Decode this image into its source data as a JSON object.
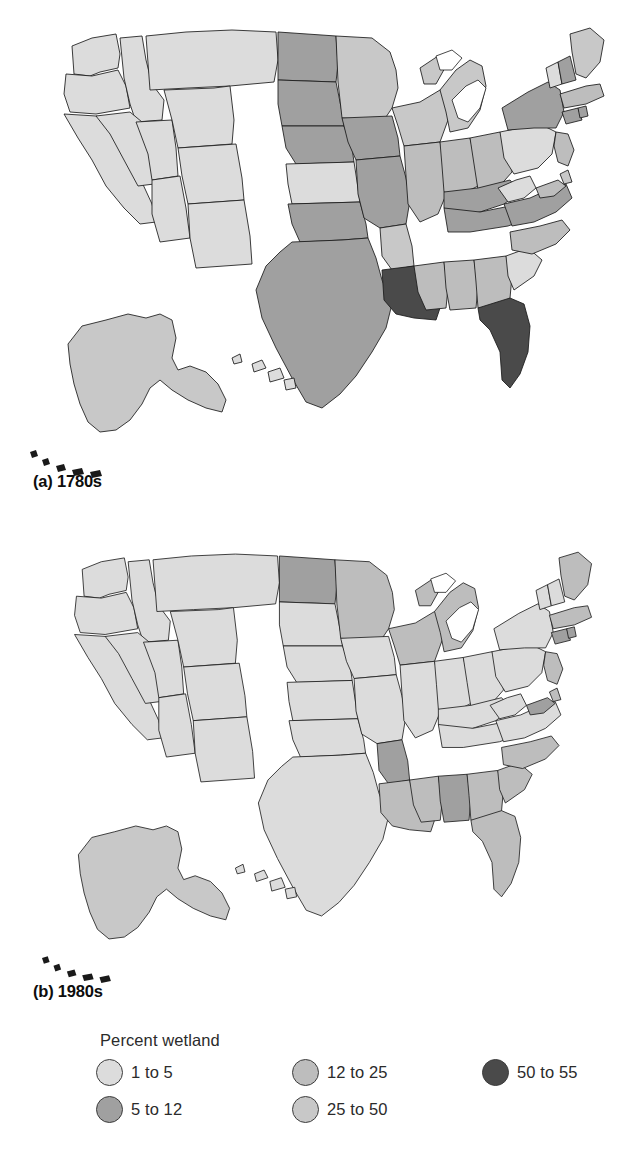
{
  "figure": {
    "panels": [
      {
        "id": "a",
        "label": "(a) 1780s",
        "period": "1780s"
      },
      {
        "id": "b",
        "label": "(b) 1980s",
        "period": "1980s"
      }
    ]
  },
  "legend": {
    "title": "Percent wetland",
    "classes": [
      {
        "label": "1 to 5",
        "color": "#dcdcdc",
        "min": 1,
        "max": 5
      },
      {
        "label": "5 to 12",
        "color": "#a0a0a0",
        "min": 5,
        "max": 12
      },
      {
        "label": "12 to 25",
        "color": "#bdbdbd",
        "min": 12,
        "max": 25
      },
      {
        "label": "25 to 50",
        "color": "#c8c8c8",
        "min": 25,
        "max": 50
      },
      {
        "label": "50 to 55",
        "color": "#4a4a4a",
        "min": 50,
        "max": 55
      }
    ]
  },
  "chart_data": {
    "type": "map",
    "title": "Percent wetland",
    "subtype": "choropleth-pair",
    "legend_position": "bottom",
    "value_unit": "percent of state area that is wetland",
    "class_breaks": [
      1,
      5,
      12,
      25,
      50,
      55
    ],
    "class_colors": [
      "#dcdcdc",
      "#a0a0a0",
      "#bdbdbd",
      "#c8c8c8",
      "#4a4a4a"
    ],
    "panels": [
      {
        "id": "a",
        "label": "(a) 1780s",
        "period": "1780s",
        "states": {
          "WA": "1 to 5",
          "OR": "1 to 5",
          "CA": "1 to 5",
          "ID": "1 to 5",
          "NV": "1 to 5",
          "UT": "1 to 5",
          "AZ": "1 to 5",
          "MT": "1 to 5",
          "WY": "1 to 5",
          "CO": "1 to 5",
          "NM": "1 to 5",
          "ND": "5 to 12",
          "SD": "5 to 12",
          "NE": "5 to 12",
          "KS": "1 to 5",
          "OK": "5 to 12",
          "TX": "5 to 12",
          "MN": "25 to 50",
          "IA": "5 to 12",
          "MO": "5 to 12",
          "AR": "25 to 50",
          "LA": "50 to 55",
          "WI": "25 to 50",
          "IL": "12 to 25",
          "MS": "12 to 25",
          "AL": "12 to 25",
          "MI": "25 to 50",
          "IN": "12 to 25",
          "KY": "5 to 12",
          "TN": "5 to 12",
          "OH": "12 to 25",
          "GA": "12 to 25",
          "FL": "50 to 55",
          "SC": "1 to 5",
          "NC": "12 to 25",
          "VA": "5 to 12",
          "WV": "1 to 5",
          "MD": "12 to 25",
          "DE": "25 to 50",
          "PA": "1 to 5",
          "NJ": "12 to 25",
          "NY": "5 to 12",
          "CT": "5 to 12",
          "RI": "5 to 12",
          "MA": "12 to 25",
          "VT": "1 to 5",
          "NH": "5 to 12",
          "ME": "25 to 50",
          "AK": "25 to 50",
          "HI": "1 to 5"
        }
      },
      {
        "id": "b",
        "label": "(b) 1980s",
        "period": "1980s",
        "states": {
          "WA": "1 to 5",
          "OR": "1 to 5",
          "CA": "1 to 5",
          "ID": "1 to 5",
          "NV": "1 to 5",
          "UT": "1 to 5",
          "AZ": "1 to 5",
          "MT": "1 to 5",
          "WY": "1 to 5",
          "CO": "1 to 5",
          "NM": "1 to 5",
          "ND": "5 to 12",
          "SD": "1 to 5",
          "NE": "1 to 5",
          "KS": "1 to 5",
          "OK": "1 to 5",
          "TX": "1 to 5",
          "MN": "12 to 25",
          "IA": "1 to 5",
          "MO": "1 to 5",
          "AR": "5 to 12",
          "LA": "12 to 25",
          "WI": "12 to 25",
          "IL": "1 to 5",
          "MS": "12 to 25",
          "AL": "5 to 12",
          "MI": "12 to 25",
          "IN": "1 to 5",
          "KY": "1 to 5",
          "TN": "1 to 5",
          "OH": "1 to 5",
          "GA": "12 to 25",
          "FL": "12 to 25",
          "SC": "12 to 25",
          "NC": "12 to 25",
          "VA": "1 to 5",
          "WV": "1 to 5",
          "MD": "5 to 12",
          "DE": "12 to 25",
          "PA": "1 to 5",
          "NJ": "12 to 25",
          "NY": "1 to 5",
          "CT": "5 to 12",
          "RI": "5 to 12",
          "MA": "12 to 25",
          "VT": "1 to 5",
          "NH": "1 to 5",
          "ME": "12 to 25",
          "AK": "25 to 50",
          "HI": "1 to 5"
        }
      }
    ]
  }
}
